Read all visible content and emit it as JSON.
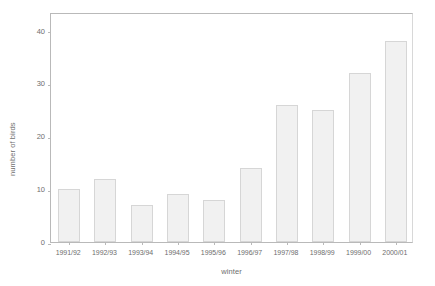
{
  "chart_data": {
    "type": "bar",
    "title": "",
    "xlabel": "winter",
    "ylabel": "number of birds",
    "categories": [
      "1991/92",
      "1992/93",
      "1993/94",
      "1994/95",
      "1995/96",
      "1996/97",
      "1997/98",
      "1998/99",
      "1999/00",
      "2000/01"
    ],
    "values": [
      10,
      12,
      7,
      9,
      8,
      14,
      26,
      25,
      32,
      38
    ],
    "ylim": [
      0,
      43.5
    ],
    "yticks": [
      0,
      10,
      20,
      30,
      40
    ],
    "ytick_labels": [
      "0",
      "10",
      "20",
      "30",
      "40"
    ],
    "grid": false,
    "legend": null,
    "colors": {
      "bar_fill": "#f1f1f1",
      "bar_border": "#d6d6d6",
      "axis": "#b9b9b9",
      "text": "#6e6e6e",
      "background": "#ffffff"
    }
  }
}
